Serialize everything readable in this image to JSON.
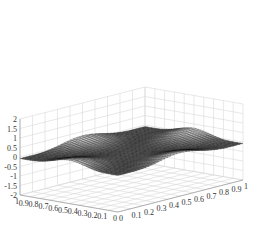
{
  "chart_data": {
    "type": "surface",
    "title": "",
    "xlabel": "",
    "ylabel": "",
    "zlabel": "",
    "xlim": [
      0,
      1
    ],
    "ylim": [
      0,
      1
    ],
    "zlim": [
      -2,
      2
    ],
    "x_ticks": [
      "0",
      "0.1",
      "0.2",
      "0.3",
      "0.4",
      "0.5",
      "0.6",
      "0.7",
      "0.8",
      "0.9",
      "1"
    ],
    "y_ticks": [
      "0",
      "0.1",
      "0.2",
      "0.3",
      "0.4",
      "0.5",
      "0.6",
      "0.7",
      "0.8",
      "0.9",
      "1"
    ],
    "z_ticks": [
      "-2",
      "-1.5",
      "-1",
      "-0.5",
      "0",
      "0.5",
      "1",
      "1.5",
      "2"
    ],
    "grid": true,
    "colormap": "gray",
    "surface_description": "Low-amplitude wavy surface (approx -0.3 to 0.3) over unit square; bright cross-shaped ridge through center with dark depressions near corners and center",
    "z_range_approx": [
      -0.3,
      0.3
    ]
  }
}
